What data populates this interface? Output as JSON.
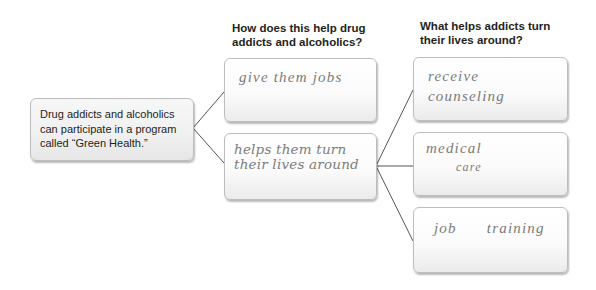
{
  "organizer": {
    "main_idea": {
      "text": "Drug addicts and alcoholics can participate in a program called “Green Health.”"
    },
    "column2": {
      "heading_line1": "How does this help drug",
      "heading_line2": "addicts and alcoholics?",
      "boxes": [
        {
          "text": "give them jobs"
        },
        {
          "line1": "helps them turn",
          "line2": "their lives around"
        }
      ]
    },
    "column3": {
      "heading_line1": "What helps addicts turn",
      "heading_line2": "their lives around?",
      "boxes": [
        {
          "line1": "receive",
          "line2": "counseling"
        },
        {
          "line1": "medical",
          "line2": "care"
        },
        {
          "line1": "job",
          "line2": "training"
        }
      ]
    },
    "colors": {
      "text": "#231f20",
      "box_border": "#bdbdbd",
      "connector": "#555555",
      "handwriting": "#7a7a7a"
    }
  }
}
